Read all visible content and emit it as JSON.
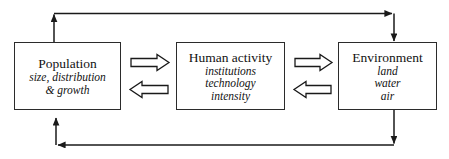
{
  "diagram": {
    "line_color": "#1a1a1a",
    "box_border_color": "#2b2b2b",
    "background_color": "#ffffff",
    "text_color": "#121212"
  },
  "nodes": [
    {
      "id": "population",
      "title": "Population",
      "subitems": [
        "size, distribution",
        "& growth"
      ]
    },
    {
      "id": "human-activity",
      "title": "Human activity",
      "subitems": [
        "institutions",
        "technology",
        "intensity"
      ]
    },
    {
      "id": "environment",
      "title": "Environment",
      "subitems": [
        "land",
        "water",
        "air"
      ]
    }
  ],
  "connectors": [
    {
      "id": "population-to-human-activity",
      "style": "block-arrow",
      "direction": "right"
    },
    {
      "id": "human-activity-to-population",
      "style": "block-arrow",
      "direction": "left"
    },
    {
      "id": "human-activity-to-environment",
      "style": "block-arrow",
      "direction": "right"
    },
    {
      "id": "environment-to-human-activity",
      "style": "block-arrow",
      "direction": "left"
    },
    {
      "id": "top-feedback-loop",
      "style": "line-arrow",
      "direction": "population-to-environment"
    },
    {
      "id": "bottom-feedback-loop",
      "style": "line-arrow",
      "direction": "environment-to-population"
    }
  ]
}
